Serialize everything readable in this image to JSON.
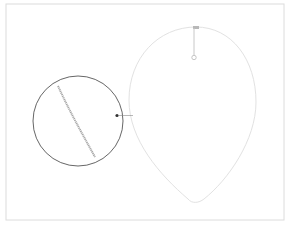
{
  "canvas": {
    "width": 287,
    "height": 227,
    "background": "#ffffff"
  },
  "frame": {
    "x": 6,
    "y": 4,
    "width": 279,
    "height": 216,
    "stroke": "#dcdcdc"
  },
  "egg_shape": {
    "stroke": "#e2e2e2",
    "top": [
      196,
      27
    ],
    "bottom": [
      195,
      203
    ],
    "left_x": 129,
    "right_x": 256
  },
  "rotation_handle": {
    "anchor": [
      196,
      28
    ],
    "knob": [
      194,
      57
    ],
    "stroke": "#c8c8c8"
  },
  "magnifier": {
    "center": [
      78,
      121
    ],
    "radius": 45,
    "stroke": "#555555",
    "detail_stroke": "#a8a8a8"
  },
  "callout": {
    "dot": [
      117,
      115
    ],
    "line_end": [
      132,
      115
    ],
    "color": "#333333"
  }
}
